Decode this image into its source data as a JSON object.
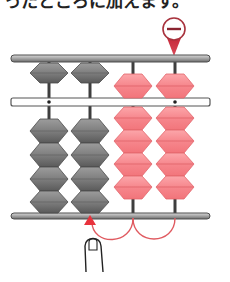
{
  "caption": {
    "text": "ったところに加えます。"
  },
  "marker": {
    "symbol": "−",
    "label": "subtract-marker",
    "color": "#b3283a"
  },
  "colors": {
    "frame": "#9a9a9a",
    "frame_dark": "#555555",
    "gray_bead": "#7a7a7a",
    "gray_bead_light": "#a8a8a8",
    "pink_bead": "#f47a80",
    "pink_bead_light": "#fbb3b6",
    "arrow": "#e0474f",
    "rod": "#444444"
  },
  "abacus": {
    "rods": [
      {
        "x": 49,
        "heaven": "up",
        "earth_count": 4,
        "earth": "down",
        "color": "gray"
      },
      {
        "x": 90,
        "heaven": "up",
        "earth_count": 4,
        "earth": "down",
        "color": "gray"
      },
      {
        "x": 133,
        "heaven": "down",
        "earth_count": 4,
        "earth": "up",
        "color": "pink"
      },
      {
        "x": 175,
        "heaven": "down",
        "earth_count": 4,
        "earth": "up",
        "color": "pink"
      }
    ],
    "unit_dots": [
      49,
      175
    ]
  },
  "annotation": {
    "finger": "finger-pointing-up",
    "arrow_target_rod": 2,
    "carry_arcs": [
      "rod4-to-rod3",
      "rod3-to-rod2"
    ]
  }
}
